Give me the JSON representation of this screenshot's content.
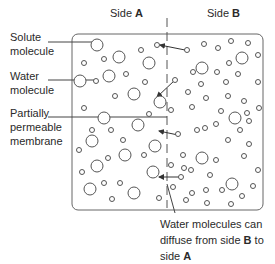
{
  "diagram": {
    "sides": {
      "a": {
        "prefix": "Side ",
        "letter": "A"
      },
      "b": {
        "prefix": "Side ",
        "letter": "B"
      }
    },
    "labels": {
      "solute": [
        "Solute",
        "molecule"
      ],
      "water": [
        "Water",
        "molecule"
      ],
      "membrane": [
        "Partially",
        "permeable",
        "membrane"
      ],
      "diffusion": {
        "line1": "Water molecules can",
        "line2_prefix": "diffuse from side ",
        "line2_bold": "B",
        "line2_suffix": " to",
        "line3_prefix": "side ",
        "line3_bold": "A"
      }
    },
    "colors": {
      "stroke": "#555555",
      "text": "#2a2a2a",
      "background": "#ffffff"
    }
  }
}
